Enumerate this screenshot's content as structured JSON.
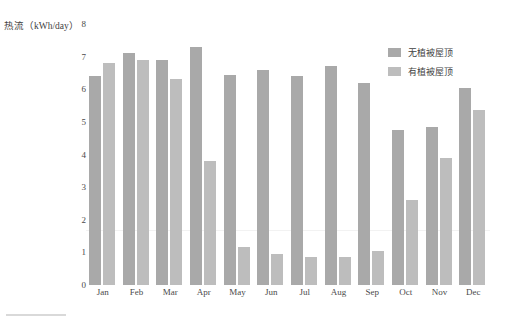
{
  "chart_data": {
    "type": "bar",
    "title": "",
    "xlabel": "",
    "ylabel": "热流（kWh/day）",
    "ylim": [
      0,
      8
    ],
    "yticks": [
      0,
      1,
      2,
      3,
      4,
      5,
      6,
      7,
      8
    ],
    "ytick_labels": [
      "0",
      "1",
      "2",
      "3",
      "4",
      "5",
      "6",
      "7",
      "8"
    ],
    "grid": false,
    "legend_position": "top-right",
    "categories": [
      "Jan",
      "Feb",
      "Mar",
      "Apr",
      "May",
      "Jun",
      "Jul",
      "Aug",
      "Sep",
      "Oct",
      "Nov",
      "Dec"
    ],
    "series": [
      {
        "name": "无植被屋顶",
        "color": "#a9a9a9",
        "values": [
          6.4,
          7.1,
          6.9,
          7.3,
          6.45,
          6.6,
          6.4,
          6.7,
          6.2,
          4.75,
          4.85,
          6.05
        ]
      },
      {
        "name": "有植被屋顶",
        "color": "#bdbdbd",
        "values": [
          6.8,
          6.9,
          6.3,
          3.8,
          1.15,
          0.95,
          0.85,
          0.85,
          1.05,
          2.6,
          3.9,
          5.35
        ]
      }
    ]
  },
  "legend": {
    "items": [
      {
        "label": "无植被屋顶",
        "color": "#a9a9a9"
      },
      {
        "label": "有植被屋顶",
        "color": "#bdbdbd"
      }
    ]
  },
  "axis": {
    "y_title": "热流（kWh/day）"
  }
}
